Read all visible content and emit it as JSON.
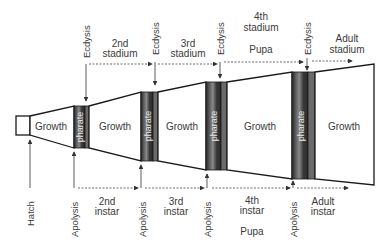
{
  "diagram": {
    "colors": {
      "outline": "#1a1a1a",
      "text": "#3a3a3a",
      "pharate_dark": "#2a2a2a",
      "pharate_light": "#bdbdbd",
      "dotted": "#444444"
    },
    "segments": [
      {
        "id": "hatch-box",
        "label": ""
      },
      {
        "id": "growth-1",
        "label": "Growth"
      },
      {
        "id": "growth-2",
        "label": "Growth"
      },
      {
        "id": "growth-3",
        "label": "Growth"
      },
      {
        "id": "growth-4",
        "label": "Growth"
      },
      {
        "id": "growth-5",
        "label": "Growth"
      }
    ],
    "pharates": [
      {
        "label": "pharate"
      },
      {
        "label": "pharate"
      },
      {
        "label": "pharate"
      },
      {
        "label": "pharate"
      }
    ],
    "top_events": [
      {
        "label": "Ecdysis"
      },
      {
        "label": "Ecdysis"
      },
      {
        "label": "Ecdysis"
      },
      {
        "label": "Ecdysis"
      }
    ],
    "bottom_events": [
      {
        "label": "Hatch"
      },
      {
        "label": "Apolysis"
      },
      {
        "label": "Apolysis"
      },
      {
        "label": "Apolysis"
      },
      {
        "label": "Apolysis"
      }
    ],
    "stadia": [
      {
        "line1": "2nd",
        "line2": "stadium",
        "extra": ""
      },
      {
        "line1": "3rd",
        "line2": "stadium",
        "extra": ""
      },
      {
        "line1": "4th",
        "line2": "stadium",
        "extra": "Pupa"
      },
      {
        "line1": "Adult",
        "line2": "stadium",
        "extra": ""
      }
    ],
    "instars": [
      {
        "line1": "2nd",
        "line2": "instar",
        "extra": ""
      },
      {
        "line1": "3rd",
        "line2": "instar",
        "extra": ""
      },
      {
        "line1": "4th",
        "line2": "instar",
        "extra": "Pupa"
      },
      {
        "line1": "Adult",
        "line2": "instar",
        "extra": ""
      }
    ]
  }
}
